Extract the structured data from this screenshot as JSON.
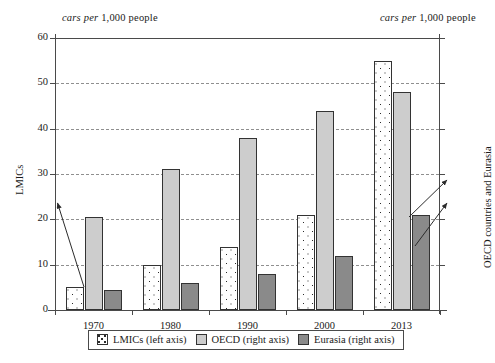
{
  "chart_data": {
    "type": "bar",
    "title": "",
    "categories": [
      "1970",
      "1980",
      "1990",
      "2000",
      "2013"
    ],
    "series": [
      {
        "name": "LMICs (left axis)",
        "axis": "left",
        "values": [
          5,
          10,
          14,
          21,
          55
        ]
      },
      {
        "name": "OECD (right axis)",
        "axis": "right",
        "values": [
          205,
          310,
          380,
          440,
          480
        ]
      },
      {
        "name": "Eurasia (right axis)",
        "axis": "right",
        "values": [
          45,
          60,
          80,
          120,
          210
        ]
      }
    ],
    "left_axis": {
      "label": "LMICs",
      "unit_caption": "cars per 1,000 people",
      "ticks": [
        0,
        10,
        20,
        30,
        40,
        50,
        60
      ],
      "ylim": [
        0,
        60
      ]
    },
    "right_axis": {
      "label": "OECD countries and Eurasia",
      "unit_caption": "cars per 1,000 people",
      "ticks": [
        0,
        100,
        200,
        300,
        400,
        500,
        600
      ],
      "ylim": [
        0,
        600
      ]
    },
    "xlabel": "",
    "grid": true,
    "legend_position": "bottom",
    "annotations": [
      {
        "name": "lmics-pointer",
        "text": ""
      },
      {
        "name": "oecd-pointer",
        "text": ""
      },
      {
        "name": "eurasia-pointer",
        "text": ""
      }
    ]
  },
  "legend": {
    "items": [
      {
        "label": "LMICs (left axis)",
        "swatch": "dotted-white"
      },
      {
        "label": "OECD (right axis)",
        "swatch": "light-gray"
      },
      {
        "label": "Eurasia (right axis)",
        "swatch": "dark-gray"
      }
    ]
  },
  "captions": {
    "left_italic": "cars per",
    "left_rest": " 1,000 people",
    "right_italic": "cars per",
    "right_rest": " 1,000 people"
  },
  "colors": {
    "lmics": "#ffffff",
    "oecd": "#cdcdcd",
    "eurasia": "#8a8a8a",
    "axis": "#4a4a4a",
    "grid": "#8f8f8f",
    "text": "#1a1a1a"
  }
}
